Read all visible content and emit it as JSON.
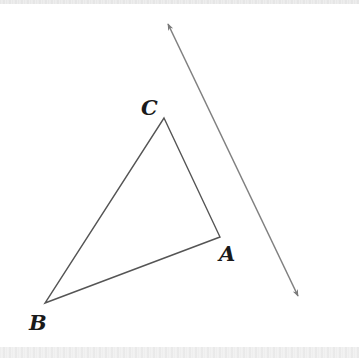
{
  "diagram": {
    "type": "geometry",
    "colors": {
      "background": "#ffffff",
      "triangle_stroke": "#555555",
      "line_stroke": "#808080",
      "label": "#1a1a1a"
    },
    "triangle": {
      "vertices": [
        {
          "name": "A",
          "x": 220,
          "y": 237
        },
        {
          "name": "B",
          "x": 45,
          "y": 303
        },
        {
          "name": "C",
          "x": 164,
          "y": 118
        }
      ]
    },
    "labels": {
      "A": "A",
      "B": "B",
      "C": "C"
    },
    "double_arrow_line": {
      "start": {
        "x": 168,
        "y": 24
      },
      "end": {
        "x": 298,
        "y": 296
      },
      "arrowheads": "both"
    }
  }
}
